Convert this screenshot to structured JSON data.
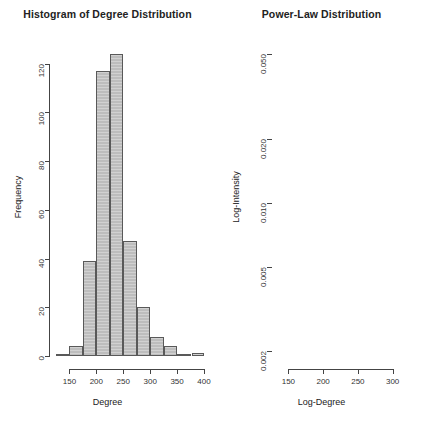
{
  "chart_data": [
    {
      "type": "bar",
      "title": "Histogram of Degree Distribution",
      "xlabel": "Degree",
      "ylabel": "Frequency",
      "xlim": [
        125,
        400
      ],
      "ylim": [
        0,
        128
      ],
      "grid": false,
      "legend": null,
      "xticks": [
        150,
        200,
        250,
        300,
        350,
        400
      ],
      "yticks": [
        0,
        20,
        40,
        60,
        80,
        100,
        120
      ],
      "bin_width": 25,
      "bin_starts": [
        125,
        150,
        175,
        200,
        225,
        250,
        275,
        300,
        325,
        350,
        375
      ],
      "categories": [
        "125-150",
        "150-175",
        "175-200",
        "200-225",
        "225-250",
        "250-275",
        "275-300",
        "300-325",
        "325-350",
        "350-375",
        "375-400"
      ],
      "values": [
        1,
        4,
        39,
        117,
        124,
        47,
        20,
        8,
        4,
        1,
        0
      ],
      "extra_bin_note": "a single isolated bar of height 1 near 390"
    },
    {
      "type": "scatter",
      "title": "Power-Law Distribution",
      "xlabel": "Log-Degree",
      "ylabel": "Log-Intensity",
      "xlim": [
        125,
        335
      ],
      "ylim": [
        0.0019,
        0.056
      ],
      "yscale": "log",
      "grid": false,
      "legend": null,
      "xticks": [
        150,
        200,
        250,
        300
      ],
      "yticks": [
        0.002,
        0.005,
        0.01,
        0.02,
        0.05
      ],
      "ytick_labels": [
        "0.002",
        "0.005",
        "0.010",
        "0.020",
        "0.050"
      ],
      "points": [
        [
          212,
          0.05
        ],
        [
          221,
          0.043
        ],
        [
          205,
          0.04
        ],
        [
          202,
          0.038
        ],
        [
          211,
          0.035
        ],
        [
          215,
          0.033
        ],
        [
          222,
          0.0315
        ],
        [
          219,
          0.029
        ],
        [
          220,
          0.0275
        ],
        [
          225,
          0.0275
        ],
        [
          229,
          0.0275
        ],
        [
          199,
          0.0262
        ],
        [
          209,
          0.0262
        ],
        [
          212,
          0.0245
        ],
        [
          231,
          0.0245
        ],
        [
          194,
          0.0225
        ],
        [
          227,
          0.0225
        ],
        [
          189,
          0.0205
        ],
        [
          205,
          0.0205
        ],
        [
          234,
          0.0205
        ],
        [
          195,
          0.0185
        ],
        [
          197,
          0.0185
        ],
        [
          232,
          0.0185
        ],
        [
          186,
          0.0165
        ],
        [
          194,
          0.0165
        ],
        [
          217,
          0.0165
        ],
        [
          222,
          0.0165
        ],
        [
          227,
          0.0165
        ],
        [
          241,
          0.0165
        ],
        [
          191,
          0.0145
        ],
        [
          228,
          0.0145
        ],
        [
          237,
          0.0145
        ],
        [
          242,
          0.0145
        ],
        [
          185,
          0.0125
        ],
        [
          230,
          0.0125
        ],
        [
          233,
          0.0125
        ],
        [
          188,
          0.01
        ],
        [
          196,
          0.01
        ],
        [
          228,
          0.01
        ],
        [
          240,
          0.01
        ],
        [
          248,
          0.01
        ],
        [
          251,
          0.01
        ],
        [
          254,
          0.01
        ],
        [
          262,
          0.01
        ],
        [
          193,
          0.0092
        ],
        [
          198,
          0.0092
        ],
        [
          236,
          0.0092
        ],
        [
          246,
          0.0092
        ],
        [
          250,
          0.0092
        ],
        [
          252,
          0.0092
        ],
        [
          254,
          0.0092
        ],
        [
          263,
          0.0092
        ],
        [
          191,
          0.0071
        ],
        [
          246,
          0.0071
        ],
        [
          254,
          0.0071
        ],
        [
          166,
          0.0044
        ],
        [
          172,
          0.0044
        ],
        [
          262,
          0.0044
        ],
        [
          266,
          0.0044
        ],
        [
          270,
          0.0044
        ],
        [
          283,
          0.0044
        ],
        [
          133,
          0.0021
        ],
        [
          155,
          0.0021
        ],
        [
          159,
          0.0021
        ],
        [
          163,
          0.0021
        ],
        [
          172,
          0.0021
        ],
        [
          256,
          0.0021
        ],
        [
          266,
          0.0021
        ],
        [
          271,
          0.0021
        ],
        [
          275,
          0.0021
        ],
        [
          279,
          0.0021
        ],
        [
          283,
          0.0021
        ],
        [
          287,
          0.0021
        ],
        [
          292,
          0.0021
        ],
        [
          297,
          0.0021
        ],
        [
          302,
          0.0021
        ],
        [
          328,
          0.0021
        ]
      ]
    }
  ],
  "panels": {
    "histogram": {
      "title": "Histogram of Degree Distribution",
      "xlabel": "Degree",
      "ylabel": "Frequency",
      "xticklabels": [
        "150",
        "200",
        "250",
        "300",
        "350",
        "400"
      ],
      "yticklabels": [
        "0",
        "20",
        "40",
        "60",
        "80",
        "100",
        "120"
      ]
    },
    "scatter": {
      "title": "Power-Law Distribution",
      "xlabel": "Log-Degree",
      "ylabel": "Log-Intensity",
      "xticklabels": [
        "150",
        "200",
        "250",
        "300"
      ],
      "yticklabels": [
        "0.002",
        "0.005",
        "0.010",
        "0.020",
        "0.050"
      ]
    }
  },
  "colors": {
    "background": "#ffffff",
    "bar_fill": "#bdbdbd",
    "bar_border": "#595959",
    "axis": "#444444",
    "text": "#222222",
    "point_stroke": "#4d4d4d"
  }
}
